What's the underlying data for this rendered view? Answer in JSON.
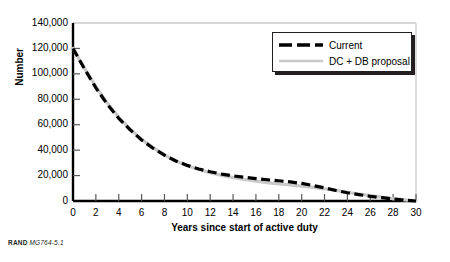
{
  "figure": {
    "source_note_prefix": "RAND",
    "source_note_code": "MG764-5.1"
  },
  "legend": {
    "position": "top-right",
    "items": [
      {
        "label": "Current",
        "color": "#000000",
        "style": "dashed"
      },
      {
        "label": "DC + DB proposal",
        "color": "#c9c9c9",
        "style": "solid"
      }
    ]
  },
  "chart_data": {
    "type": "line",
    "title": "",
    "subtitle": "",
    "xlabel": "Years since start of active duty",
    "ylabel": "Number",
    "xlim": [
      0,
      30
    ],
    "ylim": [
      0,
      140000
    ],
    "grid": false,
    "legend_position": "top-right",
    "xticks": [
      0,
      2,
      4,
      6,
      8,
      10,
      12,
      14,
      16,
      18,
      20,
      22,
      24,
      26,
      28,
      30
    ],
    "xtick_labels": [
      "0",
      "2",
      "4",
      "6",
      "8",
      "10",
      "12",
      "14",
      "16",
      "18",
      "20",
      "22",
      "24",
      "26",
      "28",
      "30"
    ],
    "yticks": [
      0,
      20000,
      40000,
      60000,
      80000,
      100000,
      120000,
      140000
    ],
    "ytick_labels": [
      "0",
      "20,000",
      "40,000",
      "60,000",
      "80,000",
      "100,000",
      "120,000",
      "140,000"
    ],
    "x": [
      0,
      1,
      2,
      3,
      4,
      5,
      6,
      7,
      8,
      9,
      10,
      11,
      12,
      13,
      14,
      15,
      16,
      17,
      18,
      19,
      20,
      21,
      22,
      23,
      24,
      25,
      26,
      27,
      28,
      29,
      30
    ],
    "series": [
      {
        "name": "Current",
        "color": "#000000",
        "style": "dashed",
        "values": [
          120000,
          104000,
          89000,
          76000,
          65000,
          56000,
          48000,
          41500,
          36000,
          31500,
          28000,
          25200,
          23000,
          21200,
          19800,
          18600,
          17600,
          16700,
          15900,
          15000,
          13800,
          12200,
          10300,
          8300,
          6500,
          5000,
          3700,
          2600,
          1600,
          700,
          0
        ]
      },
      {
        "name": "DC + DB proposal",
        "color": "#c9c9c9",
        "style": "solid",
        "values": [
          120000,
          104500,
          90000,
          77000,
          66000,
          56500,
          48500,
          42000,
          36200,
          31500,
          27800,
          24800,
          22300,
          20200,
          18400,
          16900,
          15600,
          14500,
          13500,
          12600,
          11700,
          10700,
          9600,
          8300,
          6900,
          5500,
          4200,
          3000,
          1900,
          900,
          0
        ]
      }
    ]
  }
}
